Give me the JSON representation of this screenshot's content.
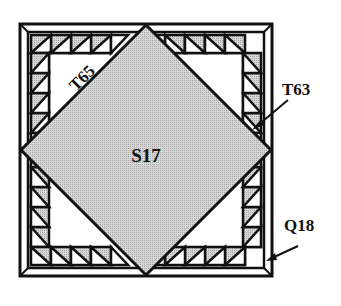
{
  "diagram": {
    "type": "quilt-block",
    "colors": {
      "line": "#111111",
      "fill_gray": "#c8c8c8",
      "center_gray": "#c4c4c4",
      "background": "#ffffff"
    },
    "labels": {
      "center": "S17",
      "corner_triangle": "T65",
      "small_triangle": "T63",
      "border_strip": "Q18"
    }
  }
}
